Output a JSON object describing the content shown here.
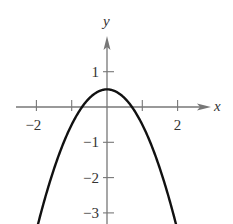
{
  "chart_data": {
    "type": "line",
    "title": "",
    "xlabel": "x",
    "ylabel": "y",
    "function": "y = -x^2 + 0.5",
    "vertex": [
      0,
      0.5
    ],
    "x_intercepts": [
      -0.707,
      0.707
    ],
    "xlim": [
      -2.0,
      2.9
    ],
    "ylim": [
      -3.3,
      2.0
    ],
    "x_ticks": [
      -2,
      -1,
      0,
      1,
      2
    ],
    "x_tick_labels": [
      "−2",
      "2"
    ],
    "y_ticks": [
      1,
      -1,
      -2,
      -3
    ],
    "y_tick_labels": [
      "1",
      "−1",
      "−2",
      "−3"
    ],
    "grid": false,
    "legend": null,
    "series": [
      {
        "name": "parabola",
        "x": [
          -1.95,
          -1.5,
          -1.0,
          -0.707,
          -0.5,
          0,
          0.5,
          0.707,
          1.0,
          1.5,
          1.95
        ],
        "y": [
          -3.3,
          -1.75,
          -0.5,
          0,
          0.25,
          0.5,
          0.25,
          0,
          -0.5,
          -1.75,
          -3.3
        ]
      }
    ],
    "colors": {
      "curve": "#111111",
      "axes": "#777777",
      "text": "#333333"
    }
  }
}
